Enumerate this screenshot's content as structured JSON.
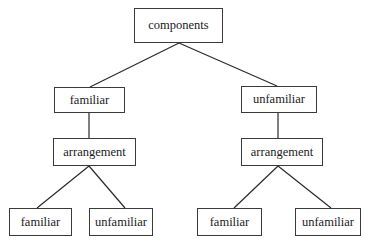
{
  "diagram": {
    "type": "tree",
    "nodes": {
      "root": {
        "label": "components"
      },
      "l_familiar": {
        "label": "familiar"
      },
      "r_unfamiliar": {
        "label": "unfamiliar"
      },
      "l_arrangement": {
        "label": "arrangement"
      },
      "r_arrangement": {
        "label": "arrangement"
      },
      "ll_familiar": {
        "label": "familiar"
      },
      "lr_unfamiliar": {
        "label": "unfamiliar"
      },
      "rl_familiar": {
        "label": "familiar"
      },
      "rr_unfamiliar": {
        "label": "unfamiliar"
      }
    },
    "edges": [
      [
        "root",
        "l_familiar"
      ],
      [
        "root",
        "r_unfamiliar"
      ],
      [
        "l_familiar",
        "l_arrangement"
      ],
      [
        "r_unfamiliar",
        "r_arrangement"
      ],
      [
        "l_arrangement",
        "ll_familiar"
      ],
      [
        "l_arrangement",
        "lr_unfamiliar"
      ],
      [
        "r_arrangement",
        "rl_familiar"
      ],
      [
        "r_arrangement",
        "rr_unfamiliar"
      ]
    ]
  }
}
